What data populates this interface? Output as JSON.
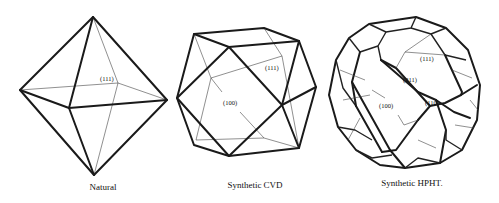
{
  "figure": {
    "panels": [
      {
        "id": "natural",
        "caption": "Natural",
        "shape": "octahedron",
        "face_labels": [
          "(111)"
        ]
      },
      {
        "id": "cvd",
        "caption": "Synthetic CVD",
        "shape": "cuboctahedron",
        "face_labels": [
          "(111)",
          "(100)"
        ]
      },
      {
        "id": "hpht",
        "caption": "Synthetic HPHT.",
        "shape": "complex polyhedron",
        "face_labels": [
          "(111)",
          "(211)",
          "(100)",
          "(110)"
        ]
      }
    ]
  }
}
